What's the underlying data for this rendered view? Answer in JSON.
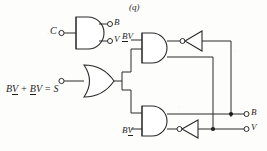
{
  "figure": {
    "caption": "(q)"
  },
  "inputs": {
    "clock": {
      "label": "C",
      "terminal": "open-circle"
    },
    "sum_equation": {
      "text_parts": [
        {
          "text": "B",
          "underline": false
        },
        {
          "text": "V",
          "underline": true
        },
        {
          "text": " + ",
          "underline": false
        },
        {
          "text": "B",
          "underline": true
        },
        {
          "text": "V",
          "underline": false
        },
        {
          "text": " = S",
          "underline": false
        }
      ],
      "plain": "BV + BV = S",
      "terminal": "open-circle"
    }
  },
  "internal_labels": {
    "top_and_input": {
      "plain": "BV",
      "parts": [
        {
          "text": "B",
          "underline": true
        },
        {
          "text": "V",
          "underline": false
        }
      ]
    },
    "bottom_and_input": {
      "plain": "BV",
      "parts": [
        {
          "text": "B",
          "underline": false
        },
        {
          "text": "V",
          "underline": true
        }
      ]
    }
  },
  "outputs": {
    "top_pair": [
      {
        "label": "B",
        "terminal": "open-circle"
      },
      {
        "label": "V",
        "terminal": "open-circle"
      }
    ],
    "right_pair": [
      {
        "label": "B",
        "terminal": "open-circle"
      },
      {
        "label": "V",
        "terminal": "open-circle"
      }
    ]
  },
  "gates": [
    {
      "name": "clock-and-gate",
      "type": "and",
      "position": "top-left"
    },
    {
      "name": "sum-or-gate",
      "type": "or",
      "position": "middle-left"
    },
    {
      "name": "set-and-gate",
      "type": "and",
      "position": "top-right"
    },
    {
      "name": "reset-and-gate",
      "type": "and",
      "position": "bottom-right"
    },
    {
      "name": "top-inverter",
      "type": "inverter",
      "position": "top-far-right"
    },
    {
      "name": "bottom-inverter",
      "type": "inverter",
      "position": "bottom-far-right"
    }
  ],
  "colors": {
    "ink": "#2a2a2a",
    "paper": "#fdfdfc"
  }
}
